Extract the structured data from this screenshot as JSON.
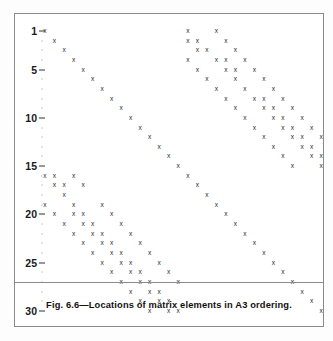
{
  "figure": {
    "caption": "Fig. 6.6—Locations of matrix elements in A3 ordering.",
    "marker_glyph": "x",
    "frame_color": "#8b8b8b",
    "marker_color": "#2a2a2a",
    "background": "#ffffff"
  },
  "axis": {
    "y_tick_labels": [
      "1",
      "5",
      "10",
      "15",
      "20",
      "25",
      "30"
    ],
    "y_tick_values": [
      1,
      5,
      10,
      15,
      20,
      25,
      30
    ],
    "y_min": 1,
    "y_max": 30,
    "x_min": 1,
    "x_max": 30,
    "x_axis_label": "",
    "y_axis_label": ""
  },
  "chart_data": {
    "type": "scatter",
    "title": "Fig. 6.6—Locations of matrix elements in A3 ordering.",
    "xlabel": "",
    "ylabel": "",
    "xlim": [
      1,
      30
    ],
    "ylim": [
      30,
      1
    ],
    "grid": false,
    "legend": null,
    "marker": "x",
    "x": [
      1,
      2,
      3,
      4,
      5,
      6,
      7,
      8,
      9,
      10,
      11,
      12,
      13,
      14,
      15,
      16,
      17,
      18,
      19,
      20,
      21,
      22,
      23,
      24,
      25,
      26,
      27,
      28,
      29,
      30,
      16,
      19,
      16,
      17,
      20,
      17,
      18,
      21,
      16,
      19,
      20,
      22,
      17,
      20,
      21,
      23,
      18,
      21,
      24,
      19,
      22,
      25,
      20,
      23,
      24,
      26,
      21,
      24,
      25,
      27,
      22,
      25,
      26,
      28,
      23,
      26,
      27,
      29,
      24,
      27,
      28,
      30,
      25,
      28,
      29,
      26,
      29,
      30,
      27,
      30,
      28,
      29,
      30,
      1,
      2,
      4,
      2,
      3,
      5,
      3,
      1,
      4,
      7,
      2,
      4,
      5,
      8,
      3,
      5,
      6,
      9,
      4,
      6,
      7,
      10,
      5,
      7,
      8,
      11,
      6,
      8,
      9,
      12,
      7,
      9,
      10,
      13,
      8,
      10,
      11,
      14,
      9,
      11,
      12,
      15,
      10,
      12,
      13,
      16,
      11,
      13,
      14,
      17,
      12,
      14,
      15,
      18,
      13,
      15,
      16,
      14,
      16,
      17,
      15,
      17,
      18,
      16,
      18,
      19,
      17,
      19,
      20,
      18,
      20,
      21
    ],
    "y": [
      1,
      2,
      3,
      4,
      5,
      6,
      7,
      8,
      9,
      10,
      11,
      12,
      13,
      14,
      15,
      16,
      17,
      18,
      19,
      20,
      21,
      22,
      23,
      24,
      25,
      26,
      27,
      28,
      29,
      30,
      1,
      1,
      2,
      2,
      2,
      3,
      3,
      3,
      4,
      4,
      4,
      4,
      5,
      5,
      5,
      5,
      6,
      6,
      6,
      7,
      7,
      7,
      8,
      8,
      8,
      8,
      9,
      9,
      9,
      9,
      10,
      10,
      10,
      10,
      11,
      11,
      11,
      11,
      12,
      12,
      12,
      12,
      13,
      13,
      13,
      14,
      14,
      14,
      15,
      15,
      16,
      16,
      16,
      16,
      16,
      16,
      17,
      17,
      17,
      18,
      19,
      19,
      19,
      20,
      20,
      20,
      20,
      21,
      21,
      21,
      21,
      22,
      22,
      22,
      22,
      23,
      23,
      23,
      23,
      24,
      24,
      24,
      24,
      25,
      25,
      25,
      25,
      26,
      26,
      26,
      26,
      27,
      27,
      27,
      27,
      28,
      28,
      28,
      28,
      29,
      29,
      29,
      29,
      30,
      30,
      30,
      30,
      22,
      22,
      22,
      23,
      23,
      23,
      24,
      24,
      24,
      25,
      25,
      25,
      26,
      26,
      26,
      27,
      27,
      27
    ]
  },
  "points": [
    {
      "c": 1,
      "r": 1
    },
    {
      "c": 2,
      "r": 2
    },
    {
      "c": 3,
      "r": 3
    },
    {
      "c": 4,
      "r": 4
    },
    {
      "c": 5,
      "r": 5
    },
    {
      "c": 6,
      "r": 6
    },
    {
      "c": 7,
      "r": 7
    },
    {
      "c": 8,
      "r": 8
    },
    {
      "c": 9,
      "r": 9
    },
    {
      "c": 10,
      "r": 10
    },
    {
      "c": 11,
      "r": 11
    },
    {
      "c": 12,
      "r": 12
    },
    {
      "c": 13,
      "r": 13
    },
    {
      "c": 14,
      "r": 14
    },
    {
      "c": 15,
      "r": 15
    },
    {
      "c": 16,
      "r": 16
    },
    {
      "c": 17,
      "r": 17
    },
    {
      "c": 18,
      "r": 18
    },
    {
      "c": 19,
      "r": 19
    },
    {
      "c": 20,
      "r": 20
    },
    {
      "c": 21,
      "r": 21
    },
    {
      "c": 22,
      "r": 22
    },
    {
      "c": 23,
      "r": 23
    },
    {
      "c": 24,
      "r": 24
    },
    {
      "c": 25,
      "r": 25
    },
    {
      "c": 26,
      "r": 26
    },
    {
      "c": 27,
      "r": 27
    },
    {
      "c": 28,
      "r": 28
    },
    {
      "c": 29,
      "r": 29
    },
    {
      "c": 30,
      "r": 30
    },
    {
      "c": 16,
      "r": 1
    },
    {
      "c": 19,
      "r": 1
    },
    {
      "c": 16,
      "r": 2
    },
    {
      "c": 17,
      "r": 2
    },
    {
      "c": 20,
      "r": 2
    },
    {
      "c": 17,
      "r": 3
    },
    {
      "c": 18,
      "r": 3
    },
    {
      "c": 21,
      "r": 3
    },
    {
      "c": 16,
      "r": 4
    },
    {
      "c": 19,
      "r": 4
    },
    {
      "c": 20,
      "r": 4
    },
    {
      "c": 22,
      "r": 4
    },
    {
      "c": 17,
      "r": 5
    },
    {
      "c": 20,
      "r": 5
    },
    {
      "c": 21,
      "r": 5
    },
    {
      "c": 23,
      "r": 5
    },
    {
      "c": 18,
      "r": 6
    },
    {
      "c": 21,
      "r": 6
    },
    {
      "c": 24,
      "r": 6
    },
    {
      "c": 19,
      "r": 7
    },
    {
      "c": 22,
      "r": 7
    },
    {
      "c": 25,
      "r": 7
    },
    {
      "c": 20,
      "r": 8
    },
    {
      "c": 23,
      "r": 8
    },
    {
      "c": 24,
      "r": 8
    },
    {
      "c": 26,
      "r": 8
    },
    {
      "c": 21,
      "r": 9
    },
    {
      "c": 24,
      "r": 9
    },
    {
      "c": 25,
      "r": 9
    },
    {
      "c": 27,
      "r": 9
    },
    {
      "c": 22,
      "r": 10
    },
    {
      "c": 25,
      "r": 10
    },
    {
      "c": 26,
      "r": 10
    },
    {
      "c": 28,
      "r": 10
    },
    {
      "c": 23,
      "r": 11
    },
    {
      "c": 26,
      "r": 11
    },
    {
      "c": 27,
      "r": 11
    },
    {
      "c": 29,
      "r": 11
    },
    {
      "c": 24,
      "r": 12
    },
    {
      "c": 27,
      "r": 12
    },
    {
      "c": 28,
      "r": 12
    },
    {
      "c": 30,
      "r": 12
    },
    {
      "c": 25,
      "r": 13
    },
    {
      "c": 28,
      "r": 13
    },
    {
      "c": 29,
      "r": 13
    },
    {
      "c": 26,
      "r": 14
    },
    {
      "c": 29,
      "r": 14
    },
    {
      "c": 30,
      "r": 14
    },
    {
      "c": 27,
      "r": 15
    },
    {
      "c": 30,
      "r": 15
    },
    {
      "c": 1,
      "r": 16
    },
    {
      "c": 2,
      "r": 16
    },
    {
      "c": 4,
      "r": 16
    },
    {
      "c": 2,
      "r": 17
    },
    {
      "c": 3,
      "r": 17
    },
    {
      "c": 5,
      "r": 17
    },
    {
      "c": 3,
      "r": 18
    },
    {
      "c": 1,
      "r": 19
    },
    {
      "c": 4,
      "r": 19
    },
    {
      "c": 7,
      "r": 19
    },
    {
      "c": 2,
      "r": 20
    },
    {
      "c": 4,
      "r": 20
    },
    {
      "c": 5,
      "r": 20
    },
    {
      "c": 8,
      "r": 20
    },
    {
      "c": 3,
      "r": 21
    },
    {
      "c": 5,
      "r": 21
    },
    {
      "c": 6,
      "r": 21
    },
    {
      "c": 9,
      "r": 21
    },
    {
      "c": 4,
      "r": 22
    },
    {
      "c": 6,
      "r": 22
    },
    {
      "c": 7,
      "r": 22
    },
    {
      "c": 10,
      "r": 22
    },
    {
      "c": 5,
      "r": 23
    },
    {
      "c": 7,
      "r": 23
    },
    {
      "c": 8,
      "r": 23
    },
    {
      "c": 11,
      "r": 23
    },
    {
      "c": 6,
      "r": 24
    },
    {
      "c": 8,
      "r": 24
    },
    {
      "c": 9,
      "r": 24
    },
    {
      "c": 12,
      "r": 24
    },
    {
      "c": 7,
      "r": 25
    },
    {
      "c": 9,
      "r": 25
    },
    {
      "c": 10,
      "r": 25
    },
    {
      "c": 13,
      "r": 25
    },
    {
      "c": 8,
      "r": 26
    },
    {
      "c": 10,
      "r": 26
    },
    {
      "c": 11,
      "r": 26
    },
    {
      "c": 14,
      "r": 26
    },
    {
      "c": 9,
      "r": 27
    },
    {
      "c": 11,
      "r": 27
    },
    {
      "c": 12,
      "r": 27
    },
    {
      "c": 15,
      "r": 27
    },
    {
      "c": 10,
      "r": 28
    },
    {
      "c": 12,
      "r": 28
    },
    {
      "c": 13,
      "r": 28
    },
    {
      "c": 11,
      "r": 29
    },
    {
      "c": 13,
      "r": 29
    },
    {
      "c": 14,
      "r": 29
    },
    {
      "c": 12,
      "r": 30
    },
    {
      "c": 14,
      "r": 30
    },
    {
      "c": 15,
      "r": 30
    }
  ],
  "geometry": {
    "x_origin_px": 30,
    "x_step_px": 9.52,
    "y_origin_px": 17,
    "y_step_px": 9.65
  }
}
